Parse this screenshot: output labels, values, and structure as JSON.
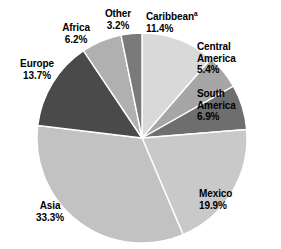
{
  "chart_data": {
    "type": "pie",
    "title": "",
    "subtitle": "",
    "xlabel": "",
    "ylabel": "",
    "legend_position": "none",
    "grid": false,
    "units": "percent",
    "start_angle_deg": 0,
    "direction": "clockwise",
    "center": {
      "x": 142,
      "y": 138
    },
    "radius": 105,
    "categories": [
      "Caribbean",
      "Central America",
      "South America",
      "Mexico",
      "Asia",
      "Europe",
      "Africa",
      "Other"
    ],
    "values": [
      11.4,
      5.4,
      6.9,
      19.9,
      33.3,
      13.7,
      6.2,
      3.2
    ],
    "slice_colors": [
      "#d9d9d9",
      "#a6a6a6",
      "#6e6e6e",
      "#c9c9c9",
      "#c2c2c2",
      "#4a4a4a",
      "#b0b0b0",
      "#7a7a7a"
    ],
    "slice_separator_color": "#ffffff",
    "annotations": [
      "Caribbean label carries a superscript footnote marker 'a'"
    ]
  },
  "labels": {
    "caribbean": {
      "name": "Caribbean",
      "footnote": "a",
      "value": "11.4%"
    },
    "central_america": {
      "name_line1": "Central",
      "name_line2": "America",
      "value": "5.4%"
    },
    "south_america": {
      "name_line1": "South",
      "name_line2": "America",
      "value": "6.9%"
    },
    "mexico": {
      "name": "Mexico",
      "value": "19.9%"
    },
    "asia": {
      "name": "Asia",
      "value": "33.3%"
    },
    "europe": {
      "name": "Europe",
      "value": "13.7%"
    },
    "africa": {
      "name": "Africa",
      "value": "6.2%"
    },
    "other": {
      "name": "Other",
      "value": "3.2%"
    }
  }
}
